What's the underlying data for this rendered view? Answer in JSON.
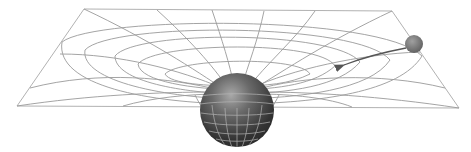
{
  "diagram": {
    "subject": "Spacetime curvature / gravity well",
    "colors": {
      "background": "#ffffff",
      "grid_line": "#9a9a9a",
      "massive_body": "#3a3a3a",
      "massive_body_highlight": "#9c9c9c",
      "small_body": "#6e6e6e",
      "trajectory_arrow": "#555555"
    },
    "elements": {
      "fabric_plane": {
        "corners": [
          [
            84,
            9
          ],
          [
            392,
            11
          ],
          [
            459,
            108
          ],
          [
            17,
            106
          ]
        ]
      },
      "massive_body": {
        "cx": 237,
        "cy": 110,
        "r": 37
      },
      "small_body": {
        "cx": 414,
        "cy": 44,
        "r": 9
      },
      "trajectory_arrow": {
        "from": [
          406,
          48
        ],
        "to": [
          342,
          65
        ]
      }
    }
  }
}
